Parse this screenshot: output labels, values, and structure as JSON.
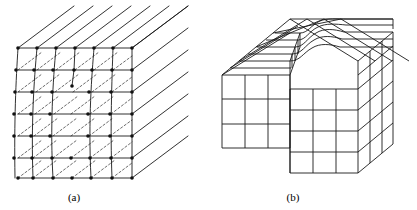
{
  "figure": {
    "kind": "line-diagram",
    "background_color": "#ffffff",
    "stroke_color": "#1a1a1a",
    "atom_color": "#111111",
    "panels": [
      {
        "id": "panel-a",
        "caption": "(a)",
        "subject": "edge-dislocation",
        "description": "Cubic crystal block drawn in oblique projection with lattice planes, atom positions marked as dots on the front face, and an extra half-plane terminating at the dislocation core",
        "caption_x": 74,
        "caption_y": 201,
        "front_face": {
          "left": 18,
          "right": 132,
          "top": 48,
          "bottom": 178,
          "columns": 6,
          "rows": 6
        },
        "oblique": {
          "dx": 56,
          "dy": -42,
          "line_count": 7,
          "note": "receding parallel lines toward upper right"
        },
        "dislocation": {
          "core_x": 72,
          "core_y": 86,
          "extra_half_plane": true,
          "half_plane_column_index": 3
        },
        "atom_dots": true,
        "atom_dot_radius": 1.8
      },
      {
        "id": "panel-b",
        "caption": "(b)",
        "subject": "screw-dislocation",
        "description": "Block of unit cubes in oblique projection showing a surface step with curved lattice lines spiralling about the dislocation line",
        "caption_x": 293,
        "caption_y": 201,
        "block": {
          "origin_x": 222,
          "origin_y": 75,
          "cell_w": 23,
          "cell_h": 26,
          "columns": 6,
          "rows": 3,
          "depth_cells": 4
        },
        "oblique": {
          "dx": 17,
          "dy": -14
        },
        "step": {
          "present": true,
          "step_height_cells": 1,
          "step_column_index": 3,
          "curved_transition": true
        }
      }
    ]
  },
  "captions": {
    "a": "(a)",
    "b": "(b)"
  }
}
